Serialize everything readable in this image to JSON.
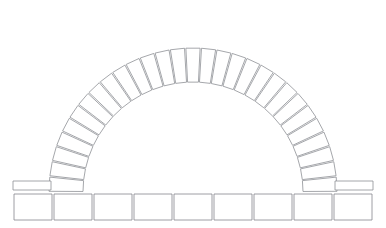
{
  "figure": {
    "background_color": "#ffffff",
    "stroke_color": "#8e9096",
    "fill_color": "#ffffff",
    "width": 386,
    "height": 228
  },
  "arch": {
    "label": "arch-ring",
    "type": "semicircular",
    "center_x": 193,
    "springing_y": 192,
    "inner_radius": 110,
    "outer_radius": 144,
    "voussoir_count": 29,
    "start_angle_deg": 180,
    "end_angle_deg": 0,
    "joint_gap_deg": 0.55
  },
  "imposts": {
    "label": "impost-course",
    "count": 2,
    "height": 9,
    "width": 38,
    "top_y": 181,
    "left_x": 13,
    "right_x": 335
  },
  "base": {
    "label": "base-course",
    "block_count": 9,
    "top_y": 194,
    "height": 26,
    "left_x": 14,
    "right_x": 372,
    "gap": 2
  },
  "chart_data": {
    "type": "diagram",
    "elements": [
      {
        "name": "voussoirs",
        "count": 29
      },
      {
        "name": "impost blocks",
        "count": 2
      },
      {
        "name": "base blocks",
        "count": 9
      }
    ]
  }
}
